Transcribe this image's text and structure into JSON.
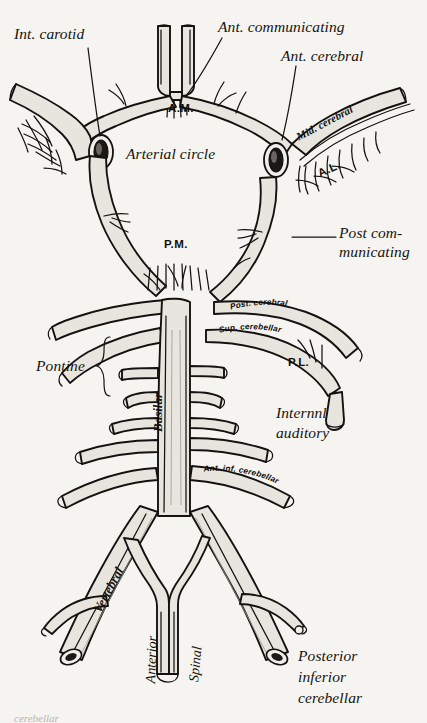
{
  "figure": {
    "background_color": "#f6f4f0",
    "ink_color": "#14120f",
    "vessel_fill": "#e7e4de",
    "width": 427,
    "height": 723
  },
  "labels": {
    "int_carotid": "Int. carotid",
    "ant_communicating": "Ant. communicating",
    "ant_cerebral": "Ant. cerebral",
    "arterial_circle": "Arterial circle",
    "mid_cerebral": "Mid. cerebral",
    "post_communicating_line1": "Post com-",
    "post_communicating_line2": "municating",
    "pontine": "Pontine",
    "internal_auditory_line1": "Internnl",
    "internal_auditory_line2": "auditory",
    "posterior_inferior_cerebellar_line1": "Posterior",
    "posterior_inferior_cerebellar_line2": "inferior",
    "posterior_inferior_cerebellar_line3": "cerebellar",
    "anterior": "Anterior",
    "spinal": "Spinal",
    "basilar": "Basilar",
    "vertebral": "Vertebral",
    "post_cerebral_curved": "Post. cerebral",
    "sup_cerebellar_curved": "Sup. cerebellar",
    "ant_inf_cerebellar_curved": "Ant. inf. cerebellar"
  },
  "abbreviations": {
    "am": "A.M.",
    "pm": "P.M.",
    "al": "A.L.",
    "pl": "P.L."
  },
  "caption": {
    "text": "cerebellar"
  }
}
